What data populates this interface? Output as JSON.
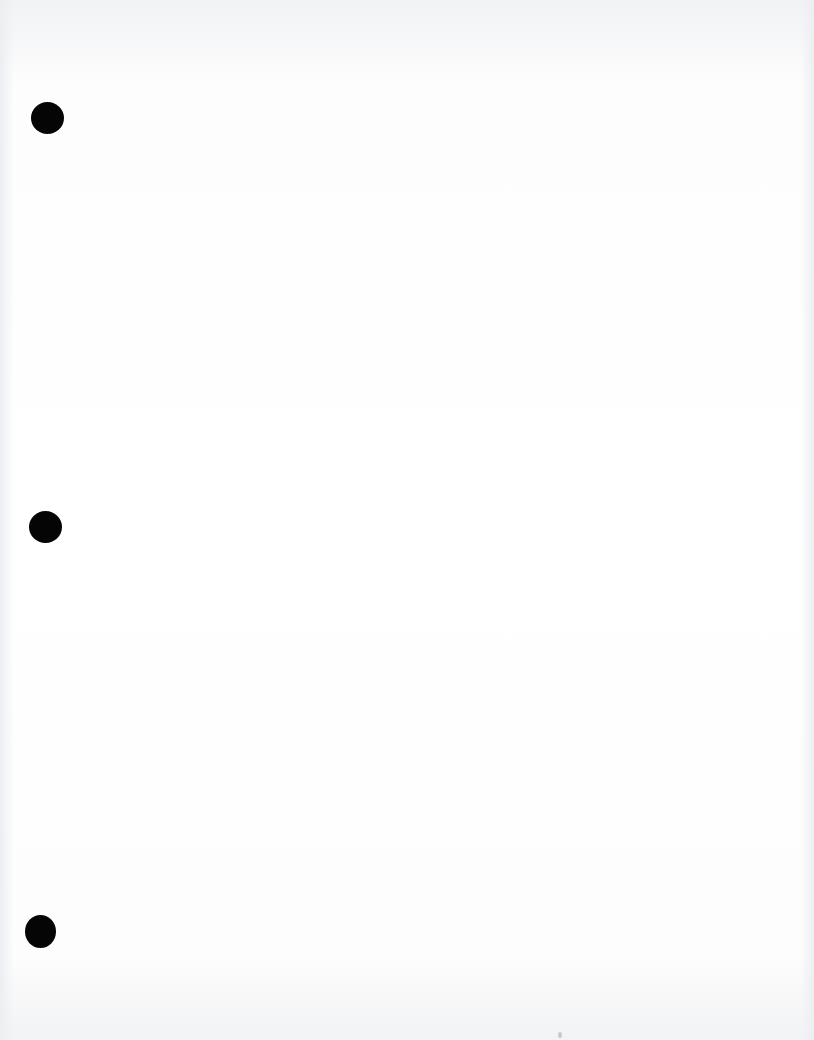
{
  "page": {
    "type": "blank scanned sheet",
    "background_color": "#ffffff",
    "text_content": ""
  },
  "punch_holes": [
    {
      "position": "top",
      "color": "#050505"
    },
    {
      "position": "middle",
      "color": "#050505"
    },
    {
      "position": "bottom",
      "color": "#050505"
    }
  ]
}
